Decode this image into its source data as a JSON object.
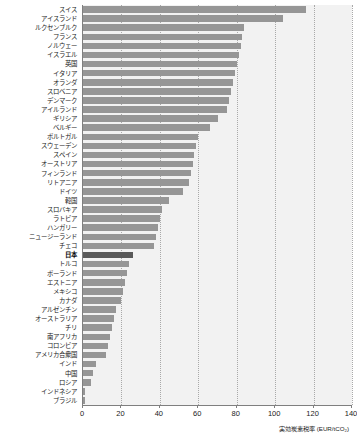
{
  "chart_data": {
    "type": "bar",
    "orientation": "horizontal",
    "title": "",
    "xlabel": "実効炭素税率 (EUR/tCO₂)",
    "ylabel": "",
    "xlim": [
      0,
      140
    ],
    "xticks": [
      0,
      20,
      40,
      60,
      80,
      100,
      120,
      140
    ],
    "xtick_labels": [
      "0",
      "20",
      "40",
      "60",
      "80",
      "100",
      "120",
      "140"
    ],
    "grid": "vertical-dotted",
    "legend": "none",
    "highlight_category": "日本",
    "colors": {
      "bar": "#969696",
      "bar_highlight": "#595959",
      "plot_background": "#f2f2f2",
      "gridline": "#a9a9a9",
      "axis": "#7f7f7f",
      "text": "#1a1a1a"
    },
    "categories": [
      "スイス",
      "アイスランド",
      "ルクセンブルク",
      "フランス",
      "ノルウェー",
      "イスラエル",
      "英国",
      "イタリア",
      "オランダ",
      "スロベニア",
      "デンマーク",
      "アイルランド",
      "ギリシア",
      "ベルギー",
      "ポルトガル",
      "スウェーデン",
      "スペイン",
      "オーストリア",
      "フィンランド",
      "リトアニア",
      "ドイツ",
      "韓国",
      "スロバキア",
      "ラトビア",
      "ハンガリー",
      "ニュージーランド",
      "チェコ",
      "日本",
      "トルコ",
      "ポーランド",
      "エストニア",
      "メキシコ",
      "カナダ",
      "アルゼンチン",
      "オーストラリア",
      "チリ",
      "南アフリカ",
      "コロンビア",
      "アメリカ合衆国",
      "インド",
      "中国",
      "ロシア",
      "インドネシア",
      "ブラジル"
    ],
    "values": [
      116,
      104,
      84,
      83,
      82,
      81,
      80,
      79,
      78,
      77,
      76,
      75,
      70,
      66,
      60,
      59,
      58,
      57,
      56,
      55,
      52,
      45,
      41,
      40,
      39,
      38,
      37,
      26,
      24,
      23,
      22,
      21,
      20,
      17,
      16,
      15,
      14,
      13,
      12,
      7,
      5,
      4,
      1,
      1
    ]
  }
}
